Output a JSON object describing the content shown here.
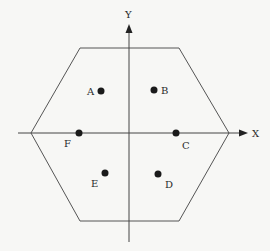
{
  "diagram": {
    "type": "hexagon-coordinate-diagram",
    "colors": {
      "background": "#f7f7f5",
      "line": "#555555",
      "axis": "#444444",
      "point": "#1a1a1a",
      "text": "#2a2a2a"
    },
    "axes": {
      "x": {
        "label": "X",
        "from": [
          18,
          133
        ],
        "to": [
          248,
          133
        ],
        "label_pos": [
          252,
          137
        ]
      },
      "y": {
        "label": "Y",
        "from": [
          129,
          242
        ],
        "to": [
          129,
          24
        ],
        "label_pos": [
          125,
          18
        ]
      }
    },
    "hexagon": {
      "vertices": [
        [
          80,
          48
        ],
        [
          179,
          48
        ],
        [
          229,
          133
        ],
        [
          179,
          221
        ],
        [
          80,
          221
        ],
        [
          31,
          133
        ]
      ]
    },
    "points": [
      {
        "name": "A",
        "dot": [
          101,
          91
        ],
        "label": [
          87,
          95
        ]
      },
      {
        "name": "B",
        "dot": [
          154,
          90
        ],
        "label": [
          161,
          94
        ]
      },
      {
        "name": "C",
        "dot": [
          176,
          133
        ],
        "label": [
          182,
          149
        ]
      },
      {
        "name": "D",
        "dot": [
          158,
          174
        ],
        "label": [
          165,
          188
        ]
      },
      {
        "name": "E",
        "dot": [
          105,
          173
        ],
        "label": [
          91,
          187
        ]
      },
      {
        "name": "F",
        "dot": [
          79,
          133
        ],
        "label": [
          64,
          147
        ]
      }
    ]
  }
}
